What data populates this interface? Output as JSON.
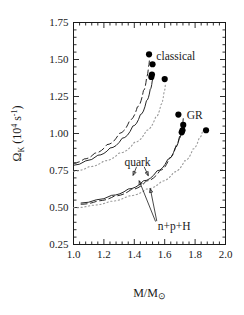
{
  "chart_data": {
    "type": "line",
    "title": "",
    "xlabel": "M/M⊙",
    "ylabel": "Ωₖ (10⁴ s⁻¹)",
    "ylabel_parts": {
      "symbol": "Ω",
      "subscript": "K",
      "units_open": "(10",
      "units_exp": "4",
      "units_s": "s",
      "units_s_exp": "-1",
      "units_close": ")"
    },
    "xlabel_parts": {
      "numerator": "M/M",
      "sun": "⊙"
    },
    "xlim": [
      1.0,
      2.0
    ],
    "ylim": [
      0.25,
      1.75
    ],
    "xticks": [
      1.0,
      1.2,
      1.4,
      1.6,
      1.8,
      2.0
    ],
    "xticklabels": [
      "1.0",
      "1.2",
      "1.4",
      "1.6",
      "1.8",
      "2.0"
    ],
    "yticks": [
      0.25,
      0.5,
      0.75,
      1.0,
      1.25,
      1.5,
      1.75
    ],
    "yticklabels": [
      "0.25",
      "0.50",
      "0.75",
      "1.00",
      "1.25",
      "1.50",
      "1.75"
    ],
    "x_minor_step": 0.04,
    "y_minor_step": 0.05,
    "grid": false,
    "legend_position": "inline-annotations",
    "annotations": [
      {
        "text": "classical",
        "x": 1.545,
        "y": 1.525,
        "anchor": "start"
      },
      {
        "text": "GR",
        "x": 1.745,
        "y": 1.128,
        "anchor": "start"
      },
      {
        "text": "quark",
        "x": 1.335,
        "y": 0.805,
        "anchor": "start"
      },
      {
        "text": "n+p+H",
        "x": 1.555,
        "y": 0.375,
        "anchor": "start"
      }
    ],
    "arrows": [
      {
        "from": [
          1.415,
          0.775
        ],
        "to": [
          1.392,
          0.717
        ],
        "label": "quark"
      },
      {
        "from": [
          1.465,
          0.775
        ],
        "to": [
          1.492,
          0.715
        ],
        "label": "quark"
      },
      {
        "from": [
          1.54,
          0.405
        ],
        "to": [
          1.432,
          0.681
        ],
        "label": "n+p+H"
      },
      {
        "from": [
          1.548,
          0.408
        ],
        "to": [
          1.505,
          0.628
        ],
        "label": "n+p+H"
      }
    ],
    "series": [
      {
        "name": "classical solid (n+p+H)",
        "style": "solid",
        "group": "classical",
        "x": [
          1.0,
          1.08,
          1.16,
          1.24,
          1.32,
          1.39,
          1.44,
          1.48,
          1.505,
          1.518,
          1.524
        ],
        "y": [
          0.785,
          0.815,
          0.853,
          0.902,
          0.968,
          1.05,
          1.128,
          1.222,
          1.3,
          1.355,
          1.392
        ]
      },
      {
        "name": "classical dashed (quark)",
        "style": "dashed",
        "group": "classical",
        "x": [
          1.0,
          1.07,
          1.14,
          1.22,
          1.3,
          1.37,
          1.42,
          1.46,
          1.482,
          1.494,
          1.5
        ],
        "y": [
          0.8,
          0.828,
          0.868,
          0.925,
          1.0,
          1.09,
          1.18,
          1.29,
          1.385,
          1.455,
          1.505
        ]
      },
      {
        "name": "classical dotted",
        "style": "dotted",
        "group": "classical",
        "x": [
          1.0,
          1.1,
          1.2,
          1.3,
          1.4,
          1.48,
          1.54,
          1.575,
          1.595,
          1.605
        ],
        "y": [
          0.745,
          0.775,
          0.815,
          0.868,
          0.94,
          1.022,
          1.11,
          1.195,
          1.275,
          1.34
        ]
      },
      {
        "name": "GR solid (n+p+H)",
        "style": "solid",
        "group": "GR",
        "x": [
          1.05,
          1.15,
          1.25,
          1.36,
          1.46,
          1.55,
          1.62,
          1.67,
          1.695,
          1.71,
          1.718
        ],
        "y": [
          0.53,
          0.552,
          0.582,
          0.625,
          0.68,
          0.748,
          0.825,
          0.905,
          0.965,
          1.01,
          1.04
        ]
      },
      {
        "name": "GR dashed (quark)",
        "style": "dashed",
        "group": "GR",
        "x": [
          1.05,
          1.16,
          1.27,
          1.38,
          1.48,
          1.57,
          1.63,
          1.675,
          1.7,
          1.715,
          1.722
        ],
        "y": [
          0.522,
          0.545,
          0.578,
          0.622,
          0.68,
          0.752,
          0.832,
          0.92,
          0.995,
          1.055,
          1.1
        ]
      },
      {
        "name": "GR dotted",
        "style": "dotted",
        "group": "GR",
        "x": [
          1.0,
          1.12,
          1.24,
          1.36,
          1.48,
          1.58,
          1.66,
          1.73,
          1.785,
          1.825,
          1.85
        ],
        "y": [
          0.498,
          0.515,
          0.542,
          0.578,
          0.625,
          0.678,
          0.74,
          0.815,
          0.895,
          0.965,
          1.02
        ]
      }
    ],
    "markers": {
      "style": "filled-circle",
      "color": "#000000",
      "size": 3.1,
      "points": [
        {
          "x": 1.497,
          "y": 1.535,
          "group": "classical"
        },
        {
          "x": 1.52,
          "y": 1.468,
          "group": "classical"
        },
        {
          "x": 1.516,
          "y": 1.398,
          "group": "classical"
        },
        {
          "x": 1.512,
          "y": 1.382,
          "group": "classical"
        },
        {
          "x": 1.6,
          "y": 1.368,
          "group": "classical"
        },
        {
          "x": 1.69,
          "y": 1.128,
          "group": "GR"
        },
        {
          "x": 1.722,
          "y": 1.058,
          "group": "GR"
        },
        {
          "x": 1.717,
          "y": 1.022,
          "group": "GR"
        },
        {
          "x": 1.712,
          "y": 1.008,
          "group": "GR"
        },
        {
          "x": 1.872,
          "y": 1.022,
          "group": "GR"
        }
      ]
    }
  }
}
